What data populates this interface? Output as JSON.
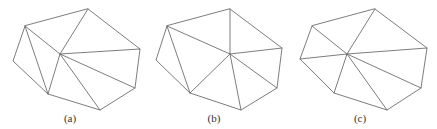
{
  "figures": [
    {
      "id": "a",
      "caption": "(a)",
      "caption_pos": [
        70,
        122
      ],
      "vertices": {
        "A": [
          25,
          26
        ],
        "B": [
          13,
          61
        ],
        "C": [
          48,
          94
        ],
        "D": [
          100,
          110
        ],
        "E": [
          135,
          88
        ],
        "F": [
          140,
          49
        ],
        "G": [
          88,
          9
        ],
        "P": [
          60,
          54
        ]
      },
      "hull": [
        "A",
        "B",
        "C",
        "D",
        "E",
        "F",
        "G"
      ],
      "edges": [
        [
          "A",
          "C"
        ],
        [
          "A",
          "P"
        ],
        [
          "G",
          "P"
        ],
        [
          "F",
          "P"
        ],
        [
          "E",
          "P"
        ],
        [
          "D",
          "P"
        ],
        [
          "C",
          "P"
        ]
      ]
    },
    {
      "id": "b",
      "caption": "(b)",
      "caption_pos": [
        214,
        122
      ],
      "vertices": {
        "A": [
          167,
          26
        ],
        "B": [
          156,
          60
        ],
        "C": [
          190,
          93
        ],
        "D": [
          241,
          110
        ],
        "E": [
          277,
          88
        ],
        "F": [
          282,
          48
        ],
        "G": [
          230,
          9
        ],
        "P": [
          230,
          54
        ]
      },
      "hull": [
        "A",
        "B",
        "C",
        "D",
        "E",
        "F",
        "G"
      ],
      "edges": [
        [
          "A",
          "C"
        ],
        [
          "A",
          "P"
        ],
        [
          "G",
          "P"
        ],
        [
          "F",
          "P"
        ],
        [
          "E",
          "P"
        ],
        [
          "D",
          "P"
        ],
        [
          "C",
          "P"
        ]
      ]
    },
    {
      "id": "c",
      "caption": "(c)",
      "caption_pos": [
        360,
        122
      ],
      "vertices": {
        "A": [
          312,
          26
        ],
        "B": [
          300,
          59
        ],
        "C": [
          334,
          93
        ],
        "D": [
          387,
          110
        ],
        "E": [
          421,
          88
        ],
        "F": [
          427,
          48
        ],
        "G": [
          375,
          9
        ],
        "P": [
          347,
          54
        ]
      },
      "hull": [
        "A",
        "B",
        "C",
        "D",
        "E",
        "F",
        "G"
      ],
      "edges": [
        [
          "A",
          "P"
        ],
        [
          "B",
          "P"
        ],
        [
          "C",
          "P"
        ],
        [
          "D",
          "P"
        ],
        [
          "E",
          "P"
        ],
        [
          "F",
          "P"
        ],
        [
          "G",
          "P"
        ]
      ]
    }
  ],
  "style": {
    "line_color": "#6e6e6e",
    "text_color": "#333333"
  }
}
